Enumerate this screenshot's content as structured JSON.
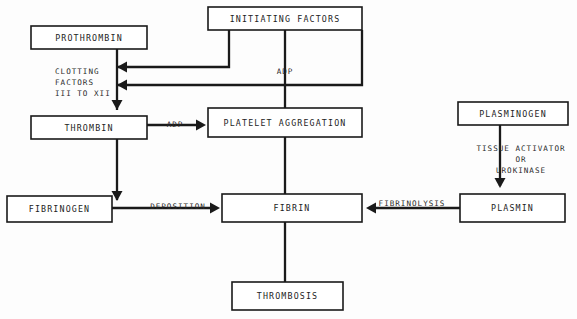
{
  "diagram": {
    "type": "flowchart",
    "background_color": "#fdfdfd",
    "line_color": "#1a1a1a",
    "text_color": "#232323",
    "nodes": [
      {
        "id": "prothrombin",
        "label": "PROTHROMBIN",
        "x": 31,
        "y": 26,
        "w": 116,
        "h": 23
      },
      {
        "id": "initiating_factors",
        "label": "INITIATING FACTORS",
        "x": 208,
        "y": 7,
        "w": 154,
        "h": 23
      },
      {
        "id": "thrombin",
        "label": "THROMBIN",
        "x": 31,
        "y": 116,
        "w": 116,
        "h": 23
      },
      {
        "id": "platelet_aggregation",
        "label": "PLATELET AGGREGATION",
        "x": 208,
        "y": 108,
        "w": 154,
        "h": 29
      },
      {
        "id": "plasminogen",
        "label": "PLASMINOGEN",
        "x": 458,
        "y": 102,
        "w": 110,
        "h": 23
      },
      {
        "id": "fibrinogen",
        "label": "FIBRINOGEN",
        "x": 7,
        "y": 196,
        "w": 105,
        "h": 26
      },
      {
        "id": "fibrin",
        "label": "FIBRIN",
        "x": 222,
        "y": 194,
        "w": 140,
        "h": 28
      },
      {
        "id": "plasmin",
        "label": "PLASMIN",
        "x": 460,
        "y": 194,
        "w": 105,
        "h": 28
      },
      {
        "id": "thrombosis",
        "label": "THROMBOSIS",
        "x": 232,
        "y": 282,
        "w": 111,
        "h": 28
      }
    ],
    "free_labels": [
      {
        "id": "clotting-factors",
        "lines": [
          "CLOTTING",
          "FACTORS",
          "III TO XII"
        ],
        "x": 55,
        "y": 72,
        "align": "start",
        "line_height": 11
      },
      {
        "id": "tissue-activator",
        "lines": [
          "TISSUE ACTIVATOR",
          "OR",
          "UROKINASE"
        ],
        "x": 521,
        "y": 149,
        "align": "middle",
        "line_height": 11
      }
    ],
    "edge_labels": [
      {
        "id": "adp-initiating",
        "text": "ADP",
        "x": 285,
        "y": 72
      },
      {
        "id": "adp-thrombin",
        "text": "ADP",
        "x": 175,
        "y": 125
      },
      {
        "id": "deposition",
        "text": "DEPOSITION",
        "x": 178,
        "y": 207
      },
      {
        "id": "fibrinolysis",
        "text": "FIBRINOLYSIS",
        "x": 412,
        "y": 204
      }
    ],
    "edges": [
      {
        "id": "initiating-to-prothrombin-path",
        "from": "initiating_factors",
        "to": "clotting-cascade",
        "points": "229,30 229,67 117,67",
        "arrow": {
          "x": 117,
          "y": 67,
          "dir": "left"
        }
      },
      {
        "id": "initiating-to-thrombin-path",
        "from": "initiating_factors",
        "to": "clotting-cascade",
        "points": "362,30 362,85 117,85",
        "arrow": {
          "x": 117,
          "y": 85,
          "dir": "left"
        }
      },
      {
        "id": "prothrombin-to-thrombin",
        "from": "prothrombin",
        "to": "thrombin",
        "points": "117,49 117,110",
        "arrow": {
          "x": 117,
          "y": 110,
          "dir": "down"
        }
      },
      {
        "id": "initiating-to-platelet",
        "from": "initiating_factors",
        "to": "platelet_aggregation",
        "points": "285,30 285,108",
        "arrow": null
      },
      {
        "id": "thrombin-adp-to-platelet",
        "from": "thrombin",
        "to": "platelet_aggregation",
        "points": "147,125 202,125",
        "arrow": {
          "x": 206,
          "y": 125,
          "dir": "right"
        }
      },
      {
        "id": "thrombin-to-deposition",
        "from": "thrombin",
        "to": "deposition-junction",
        "points": "117,139 117,200",
        "arrow": {
          "x": 117,
          "y": 201,
          "dir": "down"
        }
      },
      {
        "id": "fibrinogen-to-fibrin",
        "from": "fibrinogen",
        "to": "fibrin",
        "points": "112,208 216,208",
        "arrow": {
          "x": 220,
          "y": 208,
          "dir": "right"
        }
      },
      {
        "id": "platelet-to-fibrin",
        "from": "platelet_aggregation",
        "to": "fibrin",
        "points": "285,137 285,194",
        "arrow": null
      },
      {
        "id": "plasminogen-to-plasmin",
        "from": "plasminogen",
        "to": "plasmin",
        "points": "500,125 500,186",
        "arrow": {
          "x": 500,
          "y": 188,
          "dir": "down"
        }
      },
      {
        "id": "plasmin-to-fibrin",
        "from": "plasmin",
        "to": "fibrin",
        "points": "460,208 370,208",
        "arrow": {
          "x": 366,
          "y": 208,
          "dir": "left"
        }
      },
      {
        "id": "fibrin-to-thrombosis",
        "from": "fibrin",
        "to": "thrombosis",
        "points": "285,222 285,282",
        "arrow": null
      }
    ]
  }
}
